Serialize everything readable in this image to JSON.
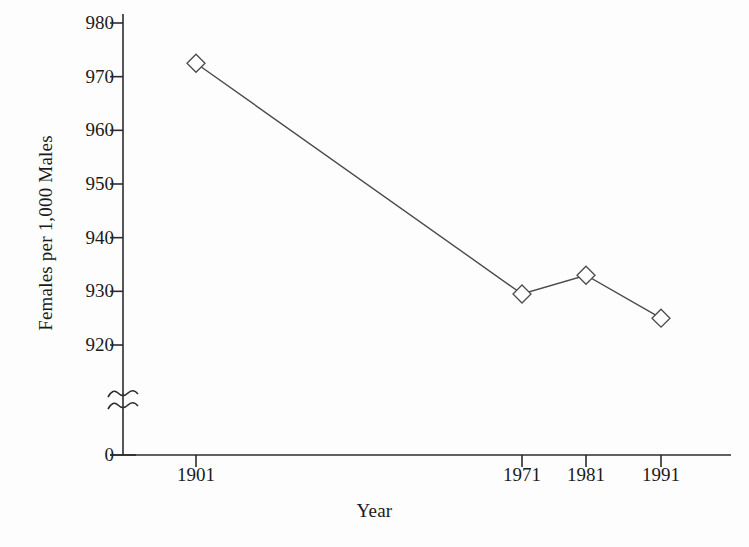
{
  "chart_data": {
    "type": "line",
    "title": "",
    "subtitle": "",
    "xlabel": "Year",
    "ylabel": "Females per 1,000 Males",
    "categories": [
      "1901",
      "1971",
      "1981",
      "1991"
    ],
    "x": [
      1901,
      1971,
      1981,
      1991
    ],
    "values": [
      972.5,
      929.5,
      933,
      925
    ],
    "series": [
      {
        "name": "Females per 1,000 Males",
        "values": [
          972.5,
          929.5,
          933,
          925
        ],
        "marker": "diamond-open",
        "color": "#4a4a4a"
      }
    ],
    "ytick_labels": [
      "980",
      "970",
      "960",
      "950",
      "940",
      "930",
      "920",
      "0"
    ],
    "ytick_values": [
      980,
      970,
      960,
      950,
      940,
      930,
      920,
      0
    ],
    "xtick_labels": [
      "1901",
      "1971",
      "1981",
      "1991"
    ],
    "ylim": [
      920,
      980
    ],
    "axis_break": true,
    "axis_break_label": "y-axis-break-squiggle",
    "grid": false,
    "legend": "none",
    "line_color": "#4a4a4a",
    "axis_color": "#2b2b2b",
    "background": "#fdfdfd"
  },
  "axes": {
    "y_title": "Females per 1,000 Males",
    "x_title": "Year"
  },
  "icons": {
    "break": "axis-break-icon",
    "marker": "diamond-marker-icon"
  }
}
